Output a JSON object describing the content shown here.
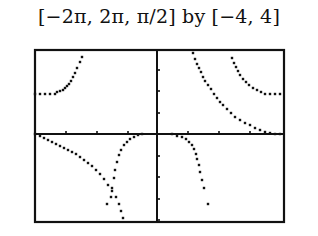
{
  "chart_data": {
    "type": "scatter",
    "title": "[−2π, 2π, π/2] by [−4, 4]",
    "xlabel": "",
    "ylabel": "",
    "xlim": [
      "-2π",
      "2π"
    ],
    "xscale": "π/2",
    "ylim": [
      -4,
      4
    ],
    "grid": false,
    "legend": "none",
    "frame": {
      "x": 35,
      "y": 50,
      "width": 249,
      "height": 172
    },
    "axes": {
      "x_axis_y": 134,
      "y_axis_x": 157
    },
    "x_ticks_px": [
      66,
      97,
      128,
      188,
      219,
      250
    ],
    "y_ticks_px": [
      70,
      91,
      113,
      156,
      177,
      199,
      220
    ],
    "series": [
      {
        "name": "upper-left branch",
        "points_px": [
          [
            35,
            94
          ],
          [
            40,
            94
          ],
          [
            45,
            94
          ],
          [
            50,
            94
          ],
          [
            55,
            94
          ],
          [
            57,
            92
          ],
          [
            60,
            91
          ],
          [
            63,
            90
          ],
          [
            65,
            88
          ],
          [
            67,
            86
          ],
          [
            69,
            84
          ],
          [
            71,
            81
          ],
          [
            73,
            77
          ],
          [
            75,
            73
          ],
          [
            77,
            68
          ],
          [
            80,
            62
          ],
          [
            82,
            57
          ]
        ]
      },
      {
        "name": "upper-right steep branch",
        "points_px": [
          [
            193,
            53
          ],
          [
            195,
            59
          ],
          [
            197,
            64
          ],
          [
            199,
            68
          ],
          [
            201,
            72
          ],
          [
            203,
            77
          ],
          [
            205,
            81
          ],
          [
            208,
            85
          ],
          [
            211,
            89
          ],
          [
            214,
            94
          ],
          [
            217,
            98
          ],
          [
            220,
            102
          ],
          [
            223,
            105
          ],
          [
            227,
            109
          ],
          [
            231,
            113
          ],
          [
            235,
            117
          ],
          [
            240,
            120
          ],
          [
            245,
            123
          ],
          [
            250,
            125
          ],
          [
            255,
            128
          ],
          [
            260,
            130
          ],
          [
            265,
            132
          ],
          [
            270,
            133
          ],
          [
            275,
            134
          ],
          [
            280,
            134
          ]
        ]
      },
      {
        "name": "upper-right shallow branch",
        "points_px": [
          [
            232,
            58
          ],
          [
            234,
            63
          ],
          [
            236,
            67
          ],
          [
            238,
            71
          ],
          [
            240,
            75
          ],
          [
            243,
            79
          ],
          [
            246,
            82
          ],
          [
            249,
            85
          ],
          [
            253,
            88
          ],
          [
            257,
            90
          ],
          [
            261,
            92
          ],
          [
            265,
            94
          ],
          [
            270,
            94
          ],
          [
            275,
            94
          ],
          [
            280,
            94
          ]
        ]
      },
      {
        "name": "lower-left branch",
        "points_px": [
          [
            35,
            134
          ],
          [
            40,
            136
          ],
          [
            44,
            138
          ],
          [
            48,
            140
          ],
          [
            52,
            142
          ],
          [
            56,
            144
          ],
          [
            60,
            146
          ],
          [
            64,
            148
          ],
          [
            68,
            150
          ],
          [
            72,
            152
          ],
          [
            76,
            154
          ],
          [
            80,
            157
          ],
          [
            84,
            160
          ],
          [
            88,
            163
          ],
          [
            92,
            166
          ],
          [
            96,
            170
          ],
          [
            100,
            174
          ],
          [
            104,
            179
          ],
          [
            108,
            185
          ],
          [
            112,
            191
          ],
          [
            116,
            197
          ],
          [
            119,
            204
          ],
          [
            121,
            211
          ],
          [
            123,
            218
          ]
        ]
      },
      {
        "name": "lower-left returning branch",
        "points_px": [
          [
            142,
            134
          ],
          [
            138,
            135
          ],
          [
            134,
            137
          ],
          [
            130,
            139
          ],
          [
            127,
            142
          ],
          [
            124,
            145
          ],
          [
            121,
            150
          ],
          [
            119,
            155
          ],
          [
            117,
            162
          ],
          [
            115,
            170
          ],
          [
            114,
            178
          ],
          [
            112,
            188
          ],
          [
            111,
            197
          ],
          [
            107,
            204
          ]
        ]
      },
      {
        "name": "lower-right branch",
        "points_px": [
          [
            172,
            134
          ],
          [
            177,
            136
          ],
          [
            182,
            137
          ],
          [
            186,
            139
          ],
          [
            189,
            142
          ],
          [
            192,
            145
          ],
          [
            194,
            149
          ],
          [
            196,
            154
          ],
          [
            197,
            159
          ],
          [
            199,
            165
          ],
          [
            200,
            172
          ],
          [
            202,
            180
          ],
          [
            204,
            188
          ],
          [
            208,
            204
          ]
        ]
      }
    ]
  }
}
